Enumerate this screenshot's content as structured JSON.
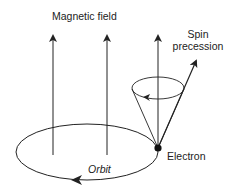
{
  "diagram": {
    "labels": {
      "magnetic_field": "Magnetic field",
      "spin_precession_line1": "Spin",
      "spin_precession_line2": "precession",
      "electron": "Electron",
      "orbit": "Orbit"
    },
    "colors": {
      "stroke": "#222222",
      "background": "#ffffff"
    },
    "elements": {
      "field_lines": 3,
      "orbit_direction": "counterclockwise (arrow pointing left at bottom)",
      "precession_direction": "arrow pointing left on front of cone rim"
    }
  }
}
